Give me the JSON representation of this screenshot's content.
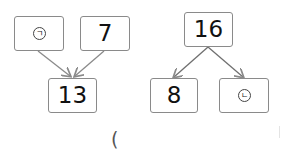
{
  "diagram_left": {
    "top_left": {
      "label": "㉠",
      "text": "ㄱ"
    },
    "top_right": {
      "label": "7"
    },
    "bottom": {
      "label": "13"
    }
  },
  "diagram_right": {
    "top": {
      "label": "16"
    },
    "bottom_left": {
      "label": "8"
    },
    "bottom_right": {
      "label": "㉡",
      "text": "ㄴ"
    }
  },
  "answer": {
    "open_paren": "("
  },
  "colors": {
    "box_border": "#8a8a8a",
    "arrow": "#8a8a8a",
    "text": "#111111"
  }
}
